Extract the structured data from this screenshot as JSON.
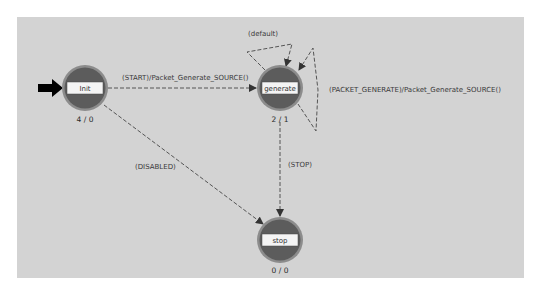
{
  "top_caption": "",
  "colors": {
    "canvas": "#d3d3d3",
    "state_fill": "#5c5c5c",
    "state_ring": "#8c8c8c",
    "state_band": "#f4f4f4",
    "transition": "#555555",
    "entry_arrow": "#000000"
  },
  "states": [
    {
      "id": "init",
      "label": "Init",
      "counts": "4 / 0",
      "cx": 85,
      "cy": 88,
      "initial": true
    },
    {
      "id": "generate",
      "label": "generate",
      "counts": "2 / 1",
      "cx": 280,
      "cy": 88,
      "initial": false
    },
    {
      "id": "stop",
      "label": "stop",
      "counts": "0 / 0",
      "cx": 280,
      "cy": 240,
      "initial": false
    }
  ],
  "transitions": [
    {
      "from": "init",
      "to": "generate",
      "label": "(START)/Packet_Generate_SOURCE()"
    },
    {
      "from": "generate",
      "to": "generate",
      "label": "(default)"
    },
    {
      "from": "generate",
      "to": "generate",
      "label": "(PACKET_GENERATE)/Packet_Generate_SOURCE()"
    },
    {
      "from": "generate",
      "to": "stop",
      "label": "(STOP)"
    },
    {
      "from": "init",
      "to": "stop",
      "label": "(DISABLED)"
    }
  ]
}
